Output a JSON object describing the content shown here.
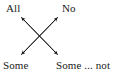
{
  "figure": {
    "name": "contradictories-cross-diagram",
    "background_color": "#ffffff",
    "ink_color": "#1a1a1a",
    "width": 119,
    "height": 75
  },
  "labels": {
    "top_left": "All",
    "top_right": "No",
    "bottom_left": "Some",
    "bottom_right": "Some ... not"
  },
  "arrows": [
    {
      "name": "arrow-all-to-some-not",
      "from": "All",
      "to": "Some ... not",
      "double_headed": true,
      "direction": "top-left-to-bottom-right"
    },
    {
      "name": "arrow-no-to-some",
      "from": "No",
      "to": "Some",
      "double_headed": true,
      "direction": "top-right-to-bottom-left"
    }
  ]
}
